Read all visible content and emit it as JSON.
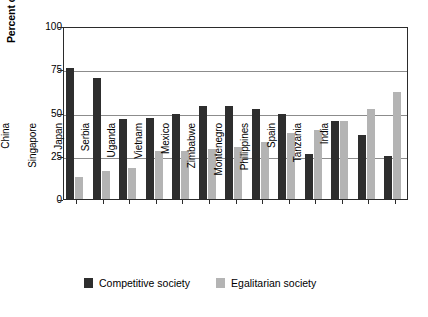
{
  "chart_data": {
    "type": "bar",
    "title": "",
    "xlabel": "",
    "ylabel": "Percent of respondents",
    "ylim": [
      0,
      100
    ],
    "yticks": [
      0,
      25,
      50,
      75,
      100
    ],
    "grid": true,
    "legend_position": "bottom",
    "categories": [
      "China",
      "Singapore",
      "Japan",
      "Serbia",
      "Uganda",
      "Vietnam",
      "Mexico",
      "Zimbabwe",
      "Montenegro",
      "Philippines",
      "Spain",
      "Tanzania",
      "India"
    ],
    "series": [
      {
        "name": "Competitive society",
        "color": "#2e2e2e",
        "values": [
          76,
          70,
          46,
          47,
          49,
          54,
          54,
          52,
          49,
          26,
          45,
          37,
          25
        ]
      },
      {
        "name": "Egalitarian society",
        "color": "#b4b4b4",
        "values": [
          13,
          16,
          18,
          28,
          28,
          29,
          30,
          33,
          38,
          40,
          45,
          52,
          62
        ]
      }
    ]
  },
  "axis": {
    "y_title": "Percent of respondents",
    "y_tick_labels": [
      "100",
      "75",
      "50",
      "25",
      "0"
    ],
    "x_tick_labels": [
      "China",
      "Singapore",
      "Japan",
      "Serbia",
      "Uganda",
      "Vietnam",
      "Mexico",
      "Zimbabwe",
      "Montenegro",
      "Philippines",
      "Spain",
      "Tanzania",
      "India"
    ]
  },
  "legend": {
    "items": [
      {
        "label": "Competitive society",
        "color": "#2e2e2e"
      },
      {
        "label": "Egalitarian society",
        "color": "#b4b4b4"
      }
    ]
  }
}
